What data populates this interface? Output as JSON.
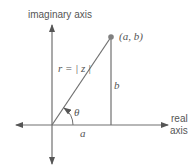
{
  "diagram": {
    "imag_axis_label": "imaginary axis",
    "real_axis_label_line1": "real",
    "real_axis_label_line2": "axis",
    "point_label": "(a, b)",
    "radius_label": "r = | z |",
    "opposite_label": "b",
    "adjacent_label": "a",
    "angle_label": "θ",
    "colors": {
      "line": "#707070",
      "point": "#808080",
      "text": "#555555"
    }
  }
}
